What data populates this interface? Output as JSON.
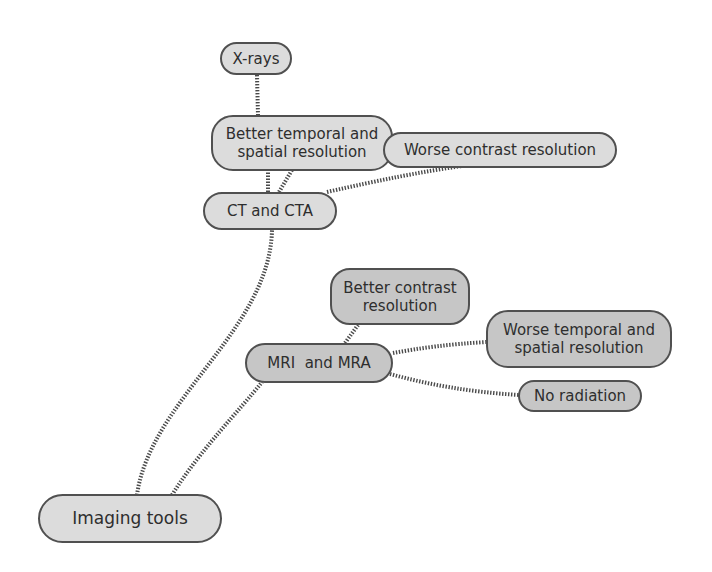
{
  "diagram": {
    "type": "mind-map",
    "colors": {
      "light_fill": "#dcdcdc",
      "dark_fill": "#c6c6c6",
      "border": "#505050",
      "text": "#2e2e2e",
      "connector": "#4a4a4a"
    },
    "nodes": {
      "root": {
        "label": "Imaging tools"
      },
      "ct": {
        "label": "CT and CTA"
      },
      "xrays": {
        "label": "X-rays"
      },
      "ct_better": {
        "line1": "Better temporal and",
        "line2": "spatial resolution"
      },
      "ct_worse": {
        "label": "Worse contrast resolution"
      },
      "mri": {
        "label": "MRI  and MRA"
      },
      "mri_better": {
        "line1": "Better contrast",
        "line2": "resolution"
      },
      "mri_worse": {
        "line1": "Worse temporal and",
        "line2": "spatial resolution"
      },
      "mri_noradiation": {
        "label": "No radiation"
      }
    },
    "edges": [
      [
        "Imaging tools",
        "CT and CTA"
      ],
      [
        "Imaging tools",
        "MRI  and MRA"
      ],
      [
        "CT and CTA",
        "Better temporal and spatial resolution"
      ],
      [
        "CT and CTA",
        "Worse contrast resolution"
      ],
      [
        "Better temporal and spatial resolution",
        "X-rays"
      ],
      [
        "MRI  and MRA",
        "Better contrast resolution"
      ],
      [
        "MRI  and MRA",
        "Worse temporal and spatial resolution"
      ],
      [
        "MRI  and MRA",
        "No radiation"
      ]
    ]
  }
}
